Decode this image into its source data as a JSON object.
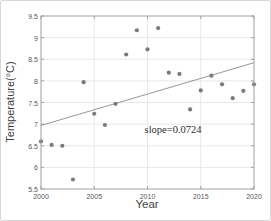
{
  "chart_data": {
    "type": "scatter",
    "xlabel": "Year",
    "ylabel": "Temperature(°C)",
    "xlim": [
      2000,
      2020
    ],
    "ylim": [
      5.5,
      9.5
    ],
    "xticks": [
      2000,
      2005,
      2010,
      2015,
      2020
    ],
    "yticks": [
      5.5,
      6,
      6.5,
      7,
      7.5,
      8,
      8.5,
      9,
      9.5
    ],
    "grid": true,
    "x": [
      2000,
      2001,
      2002,
      2003,
      2004,
      2005,
      2006,
      2007,
      2008,
      2009,
      2010,
      2011,
      2012,
      2013,
      2014,
      2015,
      2016,
      2017,
      2018,
      2019,
      2020
    ],
    "y": [
      6.6,
      6.52,
      6.5,
      5.72,
      7.97,
      7.24,
      6.98,
      7.47,
      8.61,
      9.17,
      8.73,
      9.22,
      8.19,
      8.16,
      7.34,
      7.78,
      8.12,
      7.92,
      7.6,
      7.77,
      7.92
    ],
    "trend_line": {
      "slope": 0.0724,
      "x_start": 2000,
      "y_start": 6.97,
      "x_end": 2020,
      "y_end": 8.42
    },
    "annotation": {
      "text": "slope=0.0724",
      "x": 2012.4,
      "y": 6.89
    }
  },
  "styles": {
    "marker_color": "#7a7a7a",
    "trend_line_color": "#8a8a8a",
    "axis_color": "#a0a0a0",
    "grid_color": "#e8e8e8",
    "tick_label_color": "#595959",
    "axis_label_color": "#3f3f3f",
    "annotation_color": "#2e2e2e",
    "background": "#ffffff"
  }
}
